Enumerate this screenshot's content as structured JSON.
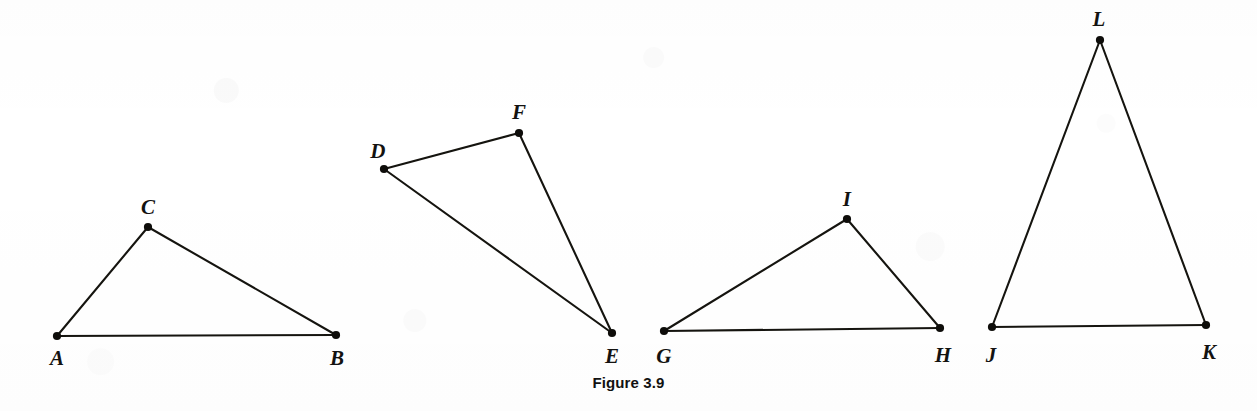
{
  "figure": {
    "caption": "Figure 3.9",
    "width": 1257,
    "height": 411,
    "background_color": "#ffffff",
    "ink_color": "#15140f"
  },
  "chart_data": {
    "type": "diagram",
    "title": "Figure 3.9",
    "subtitle": "",
    "shapes": [
      {
        "name": "triangle-abc",
        "vertices": [
          {
            "label": "A",
            "x": 57,
            "y": 336,
            "label_x": 57,
            "label_y": 358
          },
          {
            "label": "B",
            "x": 336,
            "y": 335,
            "label_x": 337,
            "label_y": 358
          },
          {
            "label": "C",
            "x": 148,
            "y": 227,
            "label_x": 148,
            "label_y": 207
          }
        ],
        "edges": [
          [
            "A",
            "C"
          ],
          [
            "C",
            "B"
          ],
          [
            "A",
            "B"
          ]
        ]
      },
      {
        "name": "triangle-def",
        "vertices": [
          {
            "label": "D",
            "x": 384,
            "y": 169,
            "label_x": 378,
            "label_y": 151
          },
          {
            "label": "E",
            "x": 612,
            "y": 333,
            "label_x": 612,
            "label_y": 356
          },
          {
            "label": "F",
            "x": 519,
            "y": 133,
            "label_x": 519,
            "label_y": 112
          }
        ],
        "edges": [
          [
            "D",
            "F"
          ],
          [
            "F",
            "E"
          ],
          [
            "D",
            "E"
          ]
        ]
      },
      {
        "name": "triangle-ghi",
        "vertices": [
          {
            "label": "G",
            "x": 664,
            "y": 331,
            "label_x": 664,
            "label_y": 356
          },
          {
            "label": "H",
            "x": 940,
            "y": 328,
            "label_x": 943,
            "label_y": 355
          },
          {
            "label": "I",
            "x": 847,
            "y": 219,
            "label_x": 847,
            "label_y": 199
          }
        ],
        "edges": [
          [
            "G",
            "I"
          ],
          [
            "I",
            "H"
          ],
          [
            "G",
            "H"
          ]
        ]
      },
      {
        "name": "triangle-jkl",
        "vertices": [
          {
            "label": "J",
            "x": 992,
            "y": 327,
            "label_x": 991,
            "label_y": 355
          },
          {
            "label": "K",
            "x": 1206,
            "y": 325,
            "label_x": 1209,
            "label_y": 352
          },
          {
            "label": "L",
            "x": 1100,
            "y": 40,
            "label_x": 1099,
            "label_y": 19
          }
        ],
        "edges": [
          [
            "J",
            "L"
          ],
          [
            "L",
            "K"
          ],
          [
            "J",
            "K"
          ]
        ]
      }
    ],
    "labels": [
      "A",
      "B",
      "C",
      "D",
      "E",
      "F",
      "G",
      "H",
      "I",
      "J",
      "K",
      "L"
    ],
    "grid": false,
    "legend": null,
    "xlabel": "",
    "ylabel": ""
  }
}
